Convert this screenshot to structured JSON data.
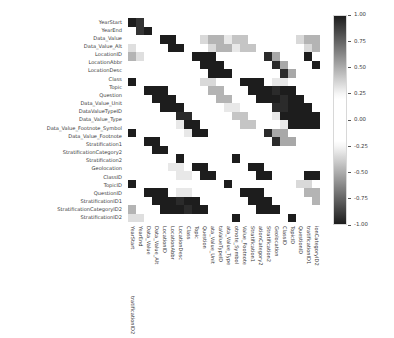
{
  "chart_data": {
    "type": "heatmap",
    "title": "",
    "xlabel": "",
    "ylabel": "",
    "colormap": "diverging-gray",
    "grid": false,
    "legend_position": "right",
    "colorbar": {
      "label": "",
      "vmin": -1.0,
      "vmax": 1.0,
      "ticks": [
        "1.00",
        "0.75",
        "0.50",
        "0.25",
        "0.00",
        "-0.25",
        "-0.50",
        "-0.75",
        "-1.00"
      ],
      "tick_values": [
        1.0,
        0.75,
        0.5,
        0.25,
        0.0,
        -0.25,
        -0.5,
        -0.75,
        -1.0
      ]
    },
    "categories": [
      "YearStart",
      "YearEnd",
      "Data_Value",
      "Data_Value_Alt",
      "LocationID",
      "LocationAbbr",
      "LocationDesc",
      "Class",
      "Topic",
      "Question",
      "Data_Value_Unit",
      "DataValueTypeID",
      "Data_Value_Type",
      "Data_Value_Footnote_Symbol",
      "Data_Value_Footnote",
      "Stratification1",
      "StratificationCategory2",
      "Stratification2",
      "Geolocation",
      "ClassID",
      "TopicID",
      "QuestionID",
      "StratificationID1",
      "StratificationCategoryID2",
      "StratificationID2"
    ],
    "xticklabels": [
      "YearStart",
      "YearEnd",
      "Data_Value",
      "Data_Value_Alt",
      "LocationID",
      "LocationAbbr",
      "LocationDesc",
      "Class",
      "Topic",
      "Question",
      "ata_Value_Unit",
      "taValueTypeID",
      "ata_Value_Type",
      "otnote_Symbol",
      "Value_Footnote",
      "Stratification1",
      "ationCategory2",
      "Stratification2",
      "Geolocation",
      "ClassID",
      "TopicID",
      "QuestionID",
      "tratificationID1",
      "ionCategoryID2",
      "tratificationID2"
    ],
    "yticklabels": [
      "YearStart",
      "YearEnd",
      "Data_Value",
      "Data_Value_Alt",
      "LocationID",
      "LocationAbbr",
      "LocationDesc",
      "Class",
      "Topic",
      "Question",
      "Data_Value_Unit",
      "DataValueTypeID",
      "Data_Value_Type",
      "Data_Value_Footnote_Symbol",
      "Data_Value_Footnote",
      "Stratification1",
      "StratificationCategory2",
      "Stratification2",
      "Geolocation",
      "ClassID",
      "TopicID",
      "QuestionID",
      "StratificationID1",
      "StratificationCategoryID2",
      "StratificationID2"
    ],
    "matrix": [
      [
        1.0,
        0.92,
        0.04,
        0.04,
        0.01,
        0.01,
        0.01,
        0.06,
        0.08,
        0.08,
        0.03,
        0.05,
        0.05,
        0.03,
        0.03,
        0.02,
        0.02,
        0.02,
        0.01,
        0.06,
        0.08,
        0.08,
        0.02,
        0.02,
        0.02
      ],
      [
        0.92,
        1.0,
        0.03,
        0.03,
        0.01,
        0.01,
        0.01,
        0.05,
        0.07,
        0.07,
        0.03,
        0.04,
        0.04,
        0.03,
        0.03,
        0.02,
        0.02,
        0.02,
        0.01,
        0.05,
        0.07,
        0.07,
        0.02,
        0.02,
        0.02
      ],
      [
        0.04,
        0.03,
        1.0,
        1.0,
        0.02,
        0.02,
        0.02,
        0.35,
        0.48,
        0.48,
        0.3,
        0.42,
        0.42,
        0.06,
        0.06,
        0.05,
        0.05,
        0.05,
        0.02,
        0.35,
        0.48,
        0.48,
        0.33,
        0.05,
        0.05
      ],
      [
        0.04,
        0.03,
        1.0,
        1.0,
        0.02,
        0.02,
        0.02,
        0.35,
        0.48,
        0.48,
        0.3,
        0.42,
        0.42,
        0.06,
        0.06,
        0.05,
        0.05,
        0.05,
        0.02,
        0.35,
        0.48,
        0.48,
        0.33,
        0.05,
        0.05
      ],
      [
        0.01,
        0.01,
        0.02,
        0.02,
        1.0,
        1.0,
        1.0,
        0.02,
        0.02,
        0.02,
        0.02,
        0.02,
        0.02,
        0.95,
        0.52,
        0.03,
        0.03,
        0.03,
        1.0,
        0.02,
        0.02,
        0.02,
        0.03,
        0.03,
        0.03
      ],
      [
        0.01,
        0.01,
        0.02,
        0.02,
        1.0,
        1.0,
        1.0,
        0.02,
        0.02,
        0.02,
        0.02,
        0.02,
        0.02,
        0.95,
        0.52,
        0.03,
        0.03,
        0.03,
        1.0,
        0.02,
        0.02,
        0.02,
        0.03,
        0.03,
        0.03
      ],
      [
        0.01,
        0.01,
        0.02,
        0.02,
        1.0,
        1.0,
        1.0,
        0.02,
        0.02,
        0.02,
        0.02,
        0.02,
        0.02,
        0.95,
        0.52,
        0.03,
        0.03,
        0.03,
        1.0,
        0.02,
        0.02,
        0.02,
        0.03,
        0.03,
        0.03
      ],
      [
        0.06,
        0.05,
        0.35,
        0.35,
        0.02,
        0.02,
        0.02,
        1.0,
        1.0,
        1.0,
        0.22,
        0.3,
        0.3,
        0.05,
        0.05,
        0.04,
        0.04,
        0.04,
        0.02,
        1.0,
        1.0,
        1.0,
        0.06,
        0.04,
        0.04
      ],
      [
        0.08,
        0.07,
        0.48,
        0.48,
        0.02,
        0.02,
        0.02,
        1.0,
        1.0,
        1.0,
        0.95,
        1.0,
        1.0,
        0.07,
        0.07,
        0.05,
        0.05,
        0.05,
        0.02,
        1.0,
        1.0,
        1.0,
        0.07,
        0.05,
        0.05
      ],
      [
        0.08,
        0.07,
        0.48,
        0.48,
        0.02,
        0.02,
        0.02,
        1.0,
        1.0,
        1.0,
        0.95,
        1.0,
        1.0,
        0.07,
        0.07,
        0.05,
        0.05,
        0.05,
        0.02,
        1.0,
        1.0,
        1.0,
        0.07,
        0.05,
        0.05
      ],
      [
        0.03,
        0.03,
        0.3,
        0.3,
        0.02,
        0.02,
        0.02,
        0.22,
        0.95,
        0.95,
        1.0,
        1.0,
        1.0,
        0.05,
        0.05,
        0.04,
        0.04,
        0.04,
        0.02,
        0.22,
        0.95,
        0.95,
        0.05,
        0.04,
        0.04
      ],
      [
        0.05,
        0.04,
        0.42,
        0.42,
        0.02,
        0.02,
        0.02,
        0.3,
        1.0,
        1.0,
        1.0,
        1.0,
        1.0,
        0.06,
        0.06,
        0.04,
        0.04,
        0.04,
        0.02,
        0.3,
        1.0,
        1.0,
        0.06,
        0.04,
        0.04
      ],
      [
        0.05,
        0.04,
        0.42,
        0.42,
        0.02,
        0.02,
        0.02,
        0.3,
        1.0,
        1.0,
        1.0,
        1.0,
        1.0,
        0.06,
        0.06,
        0.04,
        0.04,
        0.04,
        0.02,
        0.3,
        1.0,
        1.0,
        0.06,
        0.04,
        0.04
      ],
      [
        0.03,
        0.03,
        0.06,
        0.06,
        0.95,
        0.52,
        0.52,
        0.05,
        0.07,
        0.07,
        0.05,
        0.06,
        0.06,
        1.0,
        1.0,
        0.18,
        0.18,
        0.18,
        0.05,
        0.05,
        0.07,
        0.07,
        0.15,
        0.15,
        0.15
      ],
      [
        0.03,
        0.03,
        0.06,
        0.06,
        0.95,
        0.52,
        0.52,
        0.05,
        0.07,
        0.07,
        0.05,
        0.06,
        0.06,
        1.0,
        1.0,
        0.18,
        0.18,
        0.18,
        0.05,
        0.05,
        0.07,
        0.07,
        0.15,
        0.15,
        0.15
      ],
      [
        0.02,
        0.02,
        0.05,
        0.05,
        0.03,
        0.03,
        0.03,
        0.04,
        0.05,
        0.05,
        0.04,
        0.04,
        0.04,
        0.18,
        0.18,
        1.0,
        0.06,
        0.06,
        0.03,
        0.04,
        0.05,
        0.05,
        1.0,
        0.06,
        0.06
      ],
      [
        0.02,
        0.02,
        0.05,
        0.05,
        0.03,
        0.03,
        0.03,
        0.04,
        0.05,
        0.05,
        0.04,
        0.04,
        0.04,
        0.3,
        0.3,
        0.06,
        1.0,
        1.0,
        0.03,
        0.04,
        0.05,
        0.05,
        0.06,
        1.0,
        1.0
      ],
      [
        0.02,
        0.02,
        0.05,
        0.05,
        0.03,
        0.03,
        0.03,
        0.04,
        0.05,
        0.05,
        0.04,
        0.04,
        0.04,
        0.3,
        0.3,
        0.06,
        1.0,
        1.0,
        0.03,
        0.04,
        0.05,
        0.05,
        0.06,
        1.0,
        1.0
      ],
      [
        0.01,
        0.01,
        0.02,
        0.02,
        1.0,
        1.0,
        1.0,
        0.02,
        0.02,
        0.02,
        0.02,
        0.02,
        0.02,
        0.05,
        0.05,
        0.03,
        0.03,
        0.03,
        1.0,
        0.02,
        0.02,
        0.02,
        0.03,
        0.03,
        0.03
      ],
      [
        0.06,
        0.05,
        0.35,
        0.35,
        0.02,
        0.02,
        0.02,
        1.0,
        1.0,
        1.0,
        0.22,
        0.3,
        0.3,
        0.05,
        0.05,
        0.04,
        0.04,
        0.04,
        0.02,
        1.0,
        1.0,
        1.0,
        0.06,
        0.04,
        0.04
      ],
      [
        0.08,
        0.07,
        0.48,
        0.48,
        0.02,
        0.02,
        0.02,
        1.0,
        1.0,
        1.0,
        0.95,
        1.0,
        1.0,
        0.07,
        0.07,
        0.05,
        0.05,
        0.05,
        0.02,
        1.0,
        1.0,
        1.0,
        0.07,
        0.05,
        0.05
      ],
      [
        0.08,
        0.07,
        0.48,
        0.48,
        0.02,
        0.02,
        0.02,
        1.0,
        1.0,
        1.0,
        0.95,
        1.0,
        1.0,
        0.07,
        0.07,
        0.05,
        0.05,
        0.05,
        0.02,
        1.0,
        1.0,
        1.0,
        0.07,
        0.05,
        0.05
      ],
      [
        0.02,
        0.02,
        0.33,
        0.33,
        0.03,
        0.03,
        0.03,
        0.06,
        0.07,
        0.07,
        0.05,
        0.06,
        0.06,
        0.15,
        0.15,
        1.0,
        0.06,
        0.06,
        0.03,
        0.06,
        0.07,
        0.07,
        1.0,
        0.06,
        0.06
      ],
      [
        0.02,
        0.02,
        0.05,
        0.05,
        0.03,
        0.03,
        0.03,
        0.04,
        0.05,
        0.05,
        0.04,
        0.04,
        0.04,
        0.15,
        0.15,
        0.06,
        1.0,
        1.0,
        0.03,
        0.04,
        0.05,
        0.05,
        0.06,
        1.0,
        1.0
      ],
      [
        0.02,
        0.02,
        0.05,
        0.05,
        0.03,
        0.03,
        0.03,
        0.04,
        0.05,
        0.05,
        0.04,
        0.04,
        0.04,
        0.15,
        0.15,
        0.06,
        1.0,
        1.0,
        0.03,
        0.04,
        0.05,
        0.05,
        0.06,
        1.0,
        1.0
      ]
    ]
  }
}
